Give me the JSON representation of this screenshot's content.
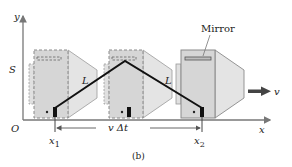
{
  "figure": {
    "caption": "(b)",
    "axes": {
      "x_label": "x",
      "y_label": "y",
      "origin_label": "O",
      "height_label": "S"
    },
    "positions": {
      "x1_label": "x",
      "x1_sub": "1",
      "x2_label": "x",
      "x2_sub": "2"
    },
    "displacement_label": "v Δt",
    "velocity_label": "v",
    "mirror_label": "Mirror",
    "path_segments": [
      {
        "label": "L"
      },
      {
        "label": "L"
      }
    ],
    "cameras": [
      {
        "state": "past",
        "style": "dashed"
      },
      {
        "state": "past",
        "style": "dashed"
      },
      {
        "state": "current",
        "style": "solid"
      }
    ],
    "colors": {
      "box_fill": "#d6d6d6",
      "box_stroke": "#8a8a8a",
      "lens_fill": "#e4e4e4",
      "light_path": "#111111",
      "axis": "#777777",
      "detector": "#111111"
    }
  }
}
